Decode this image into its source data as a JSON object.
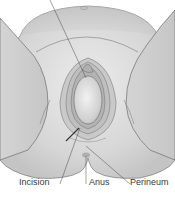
{
  "figure": {
    "labels": {
      "incision": "Incision",
      "anus": "Anus",
      "perineum": "Perineum"
    },
    "colors": {
      "background": "#ffffff",
      "skin_light": "#e4e4e4",
      "skin_mid": "#cfcfcf",
      "skin_dark": "#b5b5b5",
      "outline": "#6e6e6e",
      "leader_line": "#4a4a4a",
      "label_text": "#3a3a3a"
    }
  }
}
